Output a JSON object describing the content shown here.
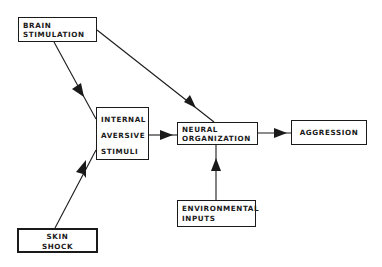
{
  "diagram": {
    "type": "flowchart",
    "nodes": {
      "brain_stimulation": {
        "lines": [
          "BRAIN",
          "STIMULATION"
        ]
      },
      "internal_aversive_stimuli": {
        "lines": [
          "INTERNAL",
          "AVERSIVE",
          "STIMULI"
        ]
      },
      "neural_organization": {
        "lines": [
          "NEURAL",
          "ORGANIZATION"
        ]
      },
      "aggression": {
        "lines": [
          "AGGRESSION"
        ]
      },
      "environmental_inputs": {
        "lines": [
          "ENVIRONMENTAL",
          "INPUTS"
        ]
      },
      "skin_shock": {
        "lines": [
          "SKIN",
          "SHOCK"
        ]
      }
    },
    "edges": [
      {
        "from": "BRAIN STIMULATION",
        "to": "INTERNAL AVERSIVE STIMULI"
      },
      {
        "from": "BRAIN STIMULATION",
        "to": "NEURAL ORGANIZATION"
      },
      {
        "from": "SKIN SHOCK",
        "to": "INTERNAL AVERSIVE STIMULI"
      },
      {
        "from": "INTERNAL AVERSIVE STIMULI",
        "to": "NEURAL ORGANIZATION"
      },
      {
        "from": "ENVIRONMENTAL INPUTS",
        "to": "NEURAL ORGANIZATION"
      },
      {
        "from": "NEURAL ORGANIZATION",
        "to": "AGGRESSION"
      }
    ],
    "colors": {
      "stroke": "#1a1a1a",
      "background": "#ffffff"
    }
  }
}
